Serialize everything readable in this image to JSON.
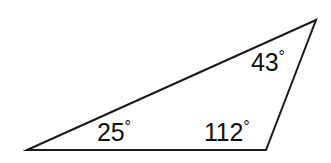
{
  "figure": {
    "kind": "geometry-diagram",
    "shape_name": "triangle",
    "background_color": "#ffffff",
    "stroke_color": "#1a1a1a",
    "stroke_width": 2,
    "fill_color": "none",
    "degree_symbol": "°",
    "vertices": [
      {
        "name": "left-vertex",
        "x": 27,
        "y": 150
      },
      {
        "name": "apex-vertex",
        "x": 316,
        "y": 20
      },
      {
        "name": "bottom-right-vertex",
        "x": 266,
        "y": 150
      }
    ],
    "polygon_points": "27,150 316,20 266,150",
    "angles": [
      {
        "id": "angle-a",
        "vertex": "left-vertex",
        "value": 25,
        "value_text": "25",
        "label_text": "25°",
        "label_x": 97,
        "label_y": 119
      },
      {
        "id": "angle-b",
        "vertex": "bottom-right-vertex",
        "value": 112,
        "value_text": "112",
        "label_text": "112°",
        "label_x": 204,
        "label_y": 119
      },
      {
        "id": "angle-c",
        "vertex": "apex-vertex",
        "value": 43,
        "value_text": "43",
        "label_text": "43°",
        "label_x": 251,
        "label_y": 49
      }
    ]
  }
}
